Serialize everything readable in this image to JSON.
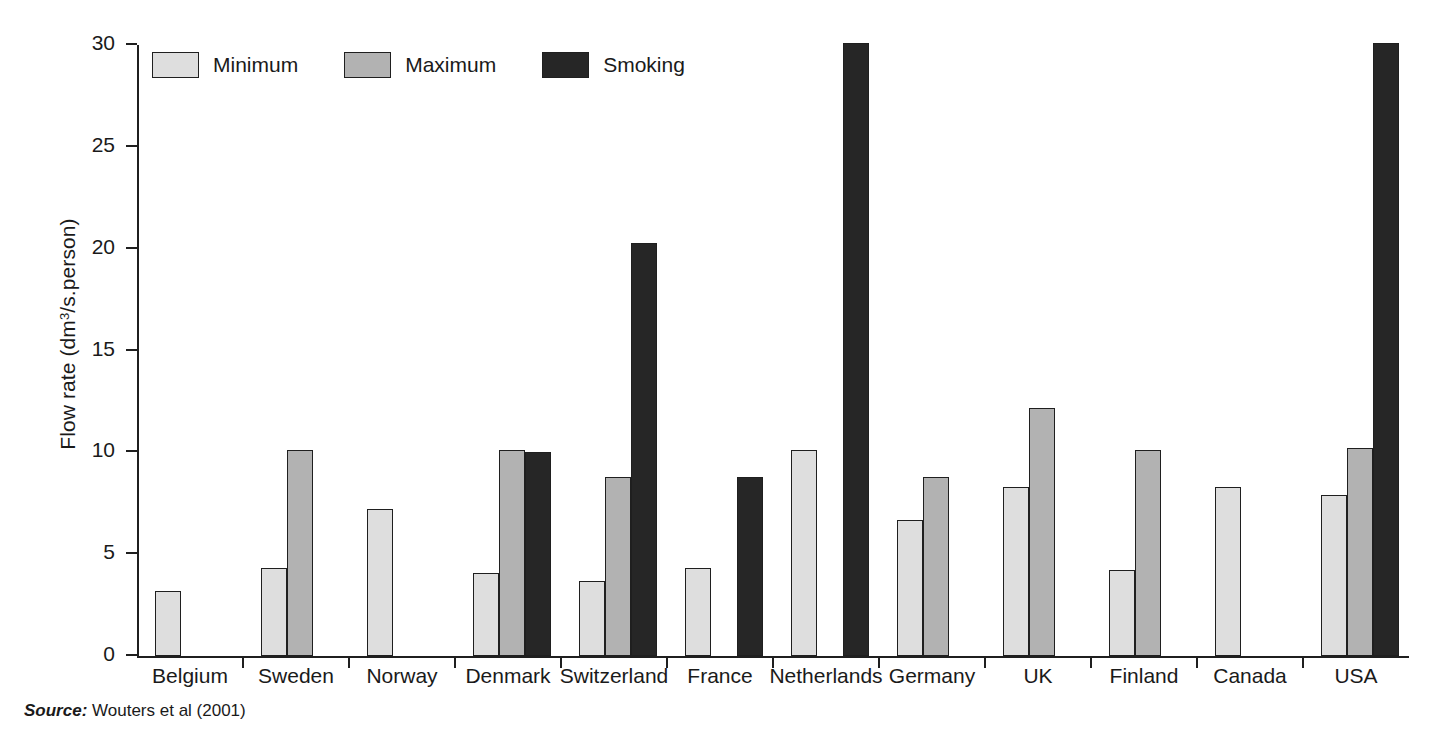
{
  "axis": {
    "ylabel_prefix": "Flow rate (dm",
    "ylabel_sup": "3",
    "ylabel_suffix": "/s.person)",
    "ylabel_full": "Flow rate (dm3/s.person)"
  },
  "legend": {
    "items": [
      {
        "label": "Minimum",
        "color": "#dedede",
        "key": "minimum"
      },
      {
        "label": "Maximum",
        "color": "#b2b2b2",
        "key": "maximum"
      },
      {
        "label": "Smoking",
        "color": "#262626",
        "key": "smoking"
      }
    ]
  },
  "source": {
    "prefix": "Source:",
    "text": "Wouters et al (2001)"
  },
  "chart_data": {
    "type": "bar",
    "title": "",
    "xlabel": "",
    "ylabel": "Flow rate (dm3/s.person)",
    "ylim": [
      0,
      30
    ],
    "yticks": [
      0,
      5,
      10,
      15,
      20,
      25,
      30
    ],
    "ytick_labels": [
      "0",
      "5",
      "10",
      "15",
      "20",
      "25",
      "30"
    ],
    "grid": false,
    "legend_position": "top-left",
    "categories": [
      "Belgium",
      "Sweden",
      "Norway",
      "Denmark",
      "Switzerland",
      "France",
      "Netherlands",
      "Germany",
      "UK",
      "Finland",
      "Canada",
      "USA"
    ],
    "series": [
      {
        "name": "Minimum",
        "color": "#dedede",
        "values": [
          3.2,
          4.3,
          7.2,
          4.1,
          3.7,
          4.3,
          10.1,
          6.7,
          8.3,
          4.2,
          8.3,
          7.9
        ]
      },
      {
        "name": "Maximum",
        "color": "#b2b2b2",
        "values": [
          null,
          10.1,
          null,
          10.1,
          8.8,
          null,
          null,
          8.8,
          12.2,
          10.1,
          null,
          10.2
        ]
      },
      {
        "name": "Smoking",
        "color": "#262626",
        "values": [
          null,
          null,
          null,
          10.0,
          20.3,
          8.8,
          30.1,
          null,
          null,
          null,
          null,
          30.1
        ]
      }
    ]
  }
}
